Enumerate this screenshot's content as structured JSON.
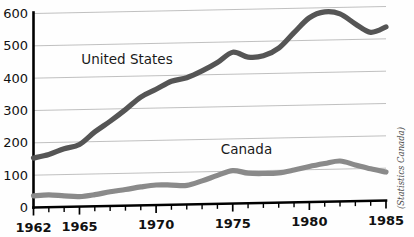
{
  "chart_data": {
    "type": "line",
    "title": "",
    "xlabel": "",
    "ylabel": "",
    "xlim": [
      1962,
      1985
    ],
    "ylim": [
      0,
      600
    ],
    "grid": true,
    "legend_position": "inline-labels",
    "x": [
      1962,
      1963,
      1964,
      1965,
      1966,
      1967,
      1968,
      1969,
      1970,
      1971,
      1972,
      1973,
      1974,
      1975,
      1976,
      1977,
      1978,
      1979,
      1980,
      1981,
      1982,
      1983,
      1984,
      1985
    ],
    "ytick_labels": [
      "0",
      "100",
      "200",
      "300",
      "400",
      "500",
      "600"
    ],
    "ytick_values": [
      0,
      100,
      200,
      300,
      400,
      500,
      600
    ],
    "xtick_labels": [
      "1962",
      "1965",
      "1970",
      "1975",
      "1980",
      "1985"
    ],
    "xtick_values": [
      1962,
      1965,
      1970,
      1975,
      1980,
      1985
    ],
    "series": [
      {
        "name": "United States",
        "color": "#555555",
        "label_x": 1968.1,
        "label_y": 437,
        "values": [
          153,
          163,
          180,
          192,
          230,
          262,
          297,
          335,
          358,
          382,
          392,
          412,
          437,
          468,
          452,
          455,
          478,
          525,
          570,
          587,
          580,
          548,
          521,
          537
        ]
      },
      {
        "name": "Canada",
        "color": "#8a8a8a",
        "label_x": 1975.9,
        "label_y": 152,
        "values": [
          36,
          38,
          34,
          31,
          36,
          44,
          50,
          57,
          62,
          61,
          59,
          72,
          88,
          102,
          93,
          91,
          92,
          100,
          110,
          118,
          125,
          112,
          99,
          88
        ]
      }
    ],
    "source": "(Statistics Canada)"
  }
}
